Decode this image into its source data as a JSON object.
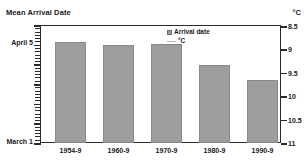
{
  "chart_data": {
    "type": "bar",
    "title": "",
    "ylabel": "Mean Arrival Date",
    "ylabel_right": "°C",
    "xlabel": "",
    "categories": [
      "1954-9",
      "1960-9",
      "1970-9",
      "1980-9",
      "1990-9"
    ],
    "values": [
      8.9,
      9.02,
      8.95,
      9.68,
      9.62
    ],
    "series": [
      {
        "name": "Arrival date",
        "values": [
          8.9,
          9.02,
          8.95,
          9.68,
          9.62
        ]
      }
    ],
    "left_axis": {
      "label": "Mean Arrival Date",
      "tick_labels": [
        "April 5",
        "March 1"
      ],
      "top_label": "April 5",
      "bottom_label": "March 1",
      "minor_ticks": true
    },
    "right_axis": {
      "label": "°C",
      "tick_labels": [
        "8.5",
        "9",
        "9.5",
        "10",
        "10.5",
        "11"
      ],
      "ylim": [
        8.5,
        11
      ],
      "inverted": true
    },
    "legend": {
      "position": "inside-top-center",
      "entries": [
        {
          "label": "Arrival date",
          "marker": "square",
          "color": "#9d9d9d"
        },
        {
          "label": "°C",
          "marker": "line",
          "color": "#b5b5b5"
        }
      ]
    },
    "grid": false,
    "bar_color": "#9d9d9d",
    "axis_color": "#2b2b2b"
  },
  "axes": {
    "left_title": "Mean Arrival Date",
    "right_title": "°C",
    "left_labels": [
      {
        "text": "April 5",
        "top_px": 42
      },
      {
        "text": "March 1",
        "top_px": 141
      }
    ],
    "right_labels": [
      {
        "text": "8.5",
        "top_px": 26
      },
      {
        "text": "9",
        "top_px": 49.4
      },
      {
        "text": "9.5",
        "top_px": 72.8
      },
      {
        "text": "10",
        "top_px": 96.2
      },
      {
        "text": "10.5",
        "top_px": 119.6
      },
      {
        "text": "11",
        "top_px": 143
      }
    ]
  },
  "bars": [
    {
      "label": "1954-9",
      "value": 8.9,
      "left_px": 14,
      "width_px": 31,
      "height_px": 101,
      "center_px": 29.5
    },
    {
      "label": "1960-9",
      "value": 9.02,
      "left_px": 62,
      "width_px": 31,
      "height_px": 98,
      "center_px": 77.5
    },
    {
      "label": "1970-9",
      "value": 8.95,
      "left_px": 110,
      "width_px": 31,
      "height_px": 99,
      "center_px": 125.5
    },
    {
      "label": "1980-9",
      "value": 9.68,
      "left_px": 158,
      "width_px": 31,
      "height_px": 78,
      "center_px": 173.5
    },
    {
      "label": "1990-9",
      "value": 9.62,
      "left_px": 206,
      "width_px": 31,
      "height_px": 63,
      "center_px": 221.5
    }
  ],
  "legend": {
    "arrival_date_label": "Arrival date",
    "celsius_label": "°C"
  }
}
